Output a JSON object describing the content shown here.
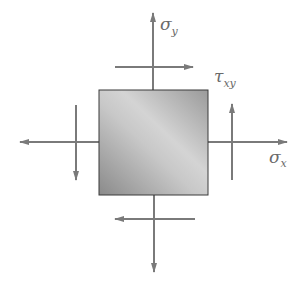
{
  "diagram": {
    "type": "plane-stress-element",
    "element": {
      "x": 99,
      "y": 90,
      "width": 109,
      "height": 105
    },
    "colors": {
      "arrow": "#7a7a7a",
      "element_fill_light": "#cfcfcf",
      "element_fill_dark": "#8a8a8a",
      "element_border": "#3a3a3a",
      "label": "#6a6a6a"
    },
    "labels": {
      "sigma_y": {
        "symbol": "σ",
        "subscript": "y"
      },
      "sigma_x": {
        "symbol": "σ",
        "subscript": "x"
      },
      "tau_xy": {
        "symbol": "τ",
        "subscript": "xy"
      }
    },
    "arrows": [
      {
        "name": "sigma-y-top",
        "from": [
          153,
          90
        ],
        "to": [
          153,
          13
        ]
      },
      {
        "name": "sigma-y-bottom",
        "from": [
          154,
          195
        ],
        "to": [
          154,
          272
        ]
      },
      {
        "name": "sigma-x-left",
        "from": [
          99,
          142
        ],
        "to": [
          20,
          142
        ]
      },
      {
        "name": "sigma-x-right",
        "from": [
          208,
          142
        ],
        "to": [
          287,
          142
        ]
      },
      {
        "name": "tau-top",
        "from": [
          115,
          67
        ],
        "to": [
          193,
          67
        ]
      },
      {
        "name": "tau-bottom",
        "from": [
          195,
          219
        ],
        "to": [
          115,
          219
        ]
      },
      {
        "name": "tau-left",
        "from": [
          76,
          105
        ],
        "to": [
          76,
          180
        ]
      },
      {
        "name": "tau-right",
        "from": [
          232,
          180
        ],
        "to": [
          232,
          104
        ]
      }
    ]
  }
}
